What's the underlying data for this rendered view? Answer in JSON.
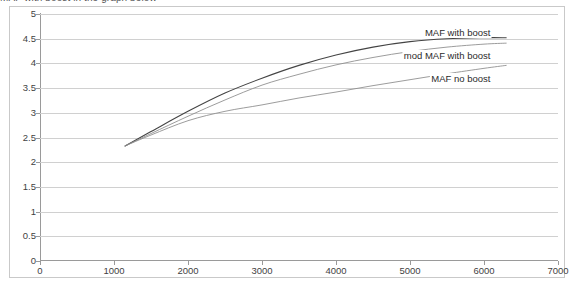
{
  "caption": {
    "text": "MAF with boost in the graph below"
  },
  "chart_data": {
    "type": "line",
    "title": "",
    "subtitle": "",
    "xlabel": "",
    "ylabel": "",
    "xlim": [
      0,
      7000
    ],
    "ylim": [
      0,
      5
    ],
    "xticks": [
      "0",
      "1000",
      "2000",
      "3000",
      "4000",
      "5000",
      "6000",
      "7000"
    ],
    "yticks": [
      "0",
      "0.5",
      "1",
      "1.5",
      "2",
      "2.5",
      "3",
      "3.5",
      "4",
      "4.5",
      "5"
    ],
    "grid": "horizontal",
    "legend_position": "inline-right-labels",
    "x": [
      1150,
      1500,
      2000,
      2500,
      3000,
      3500,
      4000,
      4500,
      5000,
      5500,
      6000,
      6300
    ],
    "series": [
      {
        "name": "MAF with boost",
        "color": "#444444",
        "values": [
          2.33,
          2.62,
          3.03,
          3.4,
          3.7,
          3.96,
          4.17,
          4.33,
          4.44,
          4.5,
          4.52,
          4.52
        ]
      },
      {
        "name": "mod MAF with boost",
        "color": "#8a8a8a",
        "values": [
          2.33,
          2.58,
          2.93,
          3.26,
          3.56,
          3.78,
          3.97,
          4.12,
          4.24,
          4.33,
          4.39,
          4.41
        ]
      },
      {
        "name": "MAF no boost",
        "color": "#8a8a8a",
        "values": [
          2.33,
          2.55,
          2.84,
          3.03,
          3.16,
          3.3,
          3.42,
          3.55,
          3.67,
          3.79,
          3.9,
          3.96
        ]
      }
    ],
    "annotations": [
      {
        "text": "MAF with boost",
        "x": 6100,
        "y": 4.62
      },
      {
        "text": "mod MAF with boost",
        "x": 6100,
        "y": 4.15
      },
      {
        "text": "MAF no boost",
        "x": 6100,
        "y": 3.68
      }
    ]
  }
}
